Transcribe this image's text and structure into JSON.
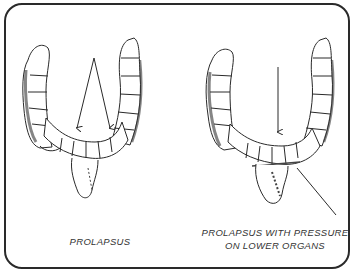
{
  "figure": {
    "panels": [
      {
        "id": "left",
        "caption": "PROLAPSUS",
        "arrows": 2,
        "description": "Colon illustration with two arrows pointing to sagging transverse colon"
      },
      {
        "id": "right",
        "caption_line1": "PROLAPSUS WITH PRESSURE",
        "caption_line2": "ON LOWER ORGANS",
        "arrows": 2,
        "description": "Colon illustration with vertical arrow to transverse colon and diagonal pointer to compressed lower organs"
      }
    ],
    "colors": {
      "line": "#2a2a2a",
      "shade": "#444444",
      "background": "#ffffff"
    }
  }
}
